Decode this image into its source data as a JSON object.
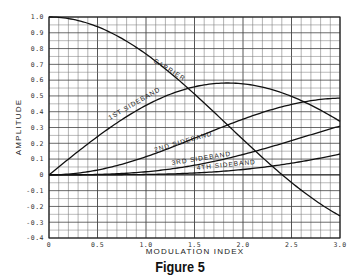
{
  "caption": "Figure 5",
  "chart_data": {
    "type": "line",
    "title": "",
    "xlabel": "MODULATION INDEX",
    "ylabel": "AMPLITUDE",
    "xlim": [
      0,
      3.0
    ],
    "ylim": [
      -0.4,
      1.0
    ],
    "grid": true,
    "x_ticks": [
      "0",
      "0.5",
      "1.0",
      "1.5",
      "2.0",
      "2.5",
      "3.0"
    ],
    "y_ticks": [
      "1.0",
      "0.9",
      "0.8",
      "0.7",
      "0.6",
      "0.5",
      "0.4",
      "0.3",
      "0.2",
      "0.1",
      "0",
      "-0.1",
      "-0.2",
      "-0.3",
      "-0.4"
    ],
    "x": [
      0,
      0.25,
      0.5,
      0.75,
      1.0,
      1.25,
      1.5,
      1.75,
      2.0,
      2.25,
      2.5,
      2.75,
      3.0
    ],
    "series": [
      {
        "name": "CARRIER",
        "values": [
          1.0,
          0.984,
          0.938,
          0.864,
          0.765,
          0.646,
          0.512,
          0.369,
          0.224,
          0.083,
          -0.048,
          -0.164,
          -0.26
        ]
      },
      {
        "name": "1ST SIDEBAND",
        "values": [
          0.0,
          0.124,
          0.242,
          0.349,
          0.44,
          0.511,
          0.558,
          0.58,
          0.577,
          0.548,
          0.497,
          0.426,
          0.339
        ]
      },
      {
        "name": "2ND SIDEBAND",
        "values": [
          0.0,
          0.008,
          0.031,
          0.067,
          0.115,
          0.172,
          0.232,
          0.293,
          0.353,
          0.405,
          0.446,
          0.474,
          0.486
        ]
      },
      {
        "name": "3RD SIDEBAND",
        "values": [
          0.0,
          0.0003,
          0.003,
          0.009,
          0.02,
          0.037,
          0.061,
          0.091,
          0.129,
          0.172,
          0.217,
          0.263,
          0.309
        ]
      },
      {
        "name": "4TH SIDEBAND",
        "values": [
          0.0,
          0.0,
          0.0002,
          0.0008,
          0.002,
          0.006,
          0.011,
          0.02,
          0.034,
          0.052,
          0.074,
          0.101,
          0.132
        ]
      }
    ],
    "annotations": [
      "CARRIER",
      "1ST SIDEBAND",
      "2ND SIDEBAND",
      "3RD SIDEBAND",
      "4TH SIDEBAND"
    ],
    "legend": "none (inline curve labels)"
  }
}
